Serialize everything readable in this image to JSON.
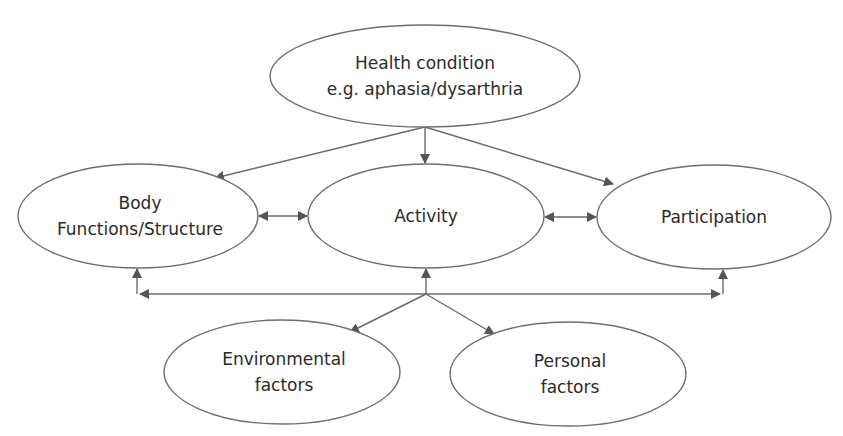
{
  "diagram": {
    "nodes": {
      "health": {
        "lines": [
          "Health condition",
          "e.g. aphasia/dysarthria"
        ]
      },
      "body": {
        "lines": [
          "Body",
          "Functions/Structure"
        ]
      },
      "activity": {
        "lines": [
          "Activity"
        ]
      },
      "participation": {
        "lines": [
          "Participation"
        ]
      },
      "environmental": {
        "lines": [
          "Environmental",
          "factors"
        ]
      },
      "personal": {
        "lines": [
          "Personal",
          "factors"
        ]
      }
    },
    "edges": [
      {
        "from": "health",
        "to": "body",
        "type": "directed"
      },
      {
        "from": "health",
        "to": "activity",
        "type": "directed"
      },
      {
        "from": "health",
        "to": "participation",
        "type": "directed"
      },
      {
        "from": "body",
        "to": "activity",
        "type": "bidirectional"
      },
      {
        "from": "activity",
        "to": "participation",
        "type": "bidirectional"
      },
      {
        "from": "contextual-junction",
        "to": "body",
        "type": "directed"
      },
      {
        "from": "contextual-junction",
        "to": "activity",
        "type": "directed"
      },
      {
        "from": "contextual-junction",
        "to": "participation",
        "type": "directed"
      },
      {
        "from": "contextual-junction",
        "to": "environmental",
        "type": "directed"
      },
      {
        "from": "contextual-junction",
        "to": "personal",
        "type": "directed"
      }
    ],
    "colors": {
      "stroke": "#6e6e6e",
      "text": "#2a2a2a",
      "background": "#ffffff"
    }
  }
}
